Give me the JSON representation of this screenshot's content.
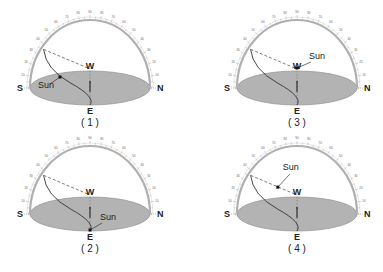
{
  "diagram": {
    "colors": {
      "ground": "#b3b3b3",
      "ground_stroke": "#9a9a9a",
      "dome": "#b0b0b0",
      "path": "#333333",
      "text": "#222222"
    },
    "direction_labels": {
      "south": "S",
      "north": "N",
      "east": "E",
      "west": "W"
    },
    "sun_label": "Sun",
    "scale_ticks": [
      "10",
      "20",
      "30",
      "40",
      "50",
      "60",
      "70",
      "80",
      "90",
      "80",
      "70",
      "60",
      "50",
      "40",
      "30",
      "20",
      "10"
    ],
    "panels": [
      {
        "id": "panel-1",
        "caption": "( 1 )",
        "cx": 90,
        "cy": 88,
        "sun_position": "on path between noon altitude and east horizon"
      },
      {
        "id": "panel-3",
        "caption": "( 3 )",
        "cx": 297,
        "cy": 88,
        "sun_position": "at west point"
      },
      {
        "id": "panel-2",
        "caption": "( 2 )",
        "cx": 90,
        "cy": 214,
        "sun_position": "at east point"
      },
      {
        "id": "panel-4",
        "caption": "( 4 )",
        "cx": 297,
        "cy": 214,
        "sun_position": "on dashed line toward west"
      }
    ]
  }
}
